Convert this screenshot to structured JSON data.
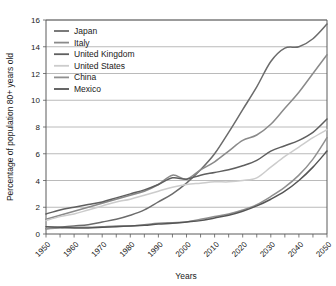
{
  "chart_data": {
    "type": "line",
    "title": "",
    "xlabel": "Years",
    "ylabel": "Percentage of population 80+ years old",
    "xlim": [
      1950,
      2050
    ],
    "ylim": [
      0,
      16
    ],
    "yticks": [
      0,
      2,
      4,
      6,
      8,
      10,
      12,
      14,
      16
    ],
    "xticks": [
      1950,
      1960,
      1970,
      1980,
      1990,
      2000,
      2010,
      2020,
      2030,
      2040,
      2050
    ],
    "xtick_labels": [
      "1950",
      "1960",
      "1970",
      "1980",
      "1990",
      "2000",
      "2010",
      "2020",
      "2030",
      "2040",
      "2050"
    ],
    "ytick_labels": [
      "0",
      "2",
      "4",
      "6",
      "8",
      "10",
      "12",
      "14",
      "16"
    ],
    "xtick_minor_step": 5,
    "grid": "horizontal",
    "legend_position": "upper-left",
    "x": [
      1950,
      1955,
      1960,
      1965,
      1970,
      1975,
      1980,
      1985,
      1990,
      1995,
      2000,
      2005,
      2010,
      2015,
      2020,
      2025,
      2030,
      2035,
      2040,
      2045,
      2050
    ],
    "series": [
      {
        "name": "Japan",
        "color": "#6b6b6b",
        "values": [
          0.4,
          0.5,
          0.6,
          0.7,
          0.9,
          1.1,
          1.4,
          1.8,
          2.4,
          3.0,
          3.8,
          4.8,
          6.0,
          7.6,
          9.3,
          11.0,
          12.9,
          13.9,
          14.0,
          14.6,
          15.7
        ]
      },
      {
        "name": "Italy",
        "color": "#8a8a8a",
        "values": [
          1.1,
          1.4,
          1.7,
          2.0,
          2.3,
          2.6,
          2.9,
          3.2,
          3.7,
          4.4,
          4.1,
          4.8,
          5.4,
          6.2,
          7.0,
          7.4,
          8.2,
          9.4,
          10.6,
          12.0,
          13.4
        ]
      },
      {
        "name": "United Kingdom",
        "color": "#5f5f5f",
        "values": [
          1.5,
          1.8,
          2.0,
          2.2,
          2.4,
          2.7,
          3.0,
          3.3,
          3.7,
          4.2,
          4.1,
          4.4,
          4.6,
          4.8,
          5.1,
          5.5,
          6.2,
          6.6,
          7.0,
          7.6,
          8.6
        ]
      },
      {
        "name": "United States",
        "color": "#cccccc",
        "values": [
          1.0,
          1.3,
          1.5,
          1.8,
          2.1,
          2.4,
          2.6,
          2.9,
          3.2,
          3.5,
          3.7,
          3.8,
          3.9,
          3.9,
          4.0,
          4.2,
          5.0,
          5.8,
          6.5,
          7.2,
          7.8
        ]
      },
      {
        "name": "China",
        "color": "#909090",
        "values": [
          0.4,
          0.45,
          0.5,
          0.5,
          0.55,
          0.6,
          0.6,
          0.7,
          0.8,
          0.85,
          0.9,
          1.1,
          1.3,
          1.5,
          1.8,
          2.2,
          2.8,
          3.5,
          4.4,
          5.6,
          7.2
        ]
      },
      {
        "name": "Mexico",
        "color": "#555555",
        "values": [
          0.55,
          0.5,
          0.45,
          0.45,
          0.5,
          0.55,
          0.6,
          0.65,
          0.75,
          0.8,
          0.9,
          1.0,
          1.2,
          1.4,
          1.7,
          2.1,
          2.6,
          3.2,
          4.0,
          5.0,
          6.2
        ]
      }
    ]
  },
  "legend": {
    "entries": [
      {
        "label": "Japan"
      },
      {
        "label": "Italy"
      },
      {
        "label": "United Kingdom"
      },
      {
        "label": "United States"
      },
      {
        "label": "China"
      },
      {
        "label": "Mexico"
      }
    ]
  },
  "axes": {
    "y_title": "Percentage of population 80+ years old",
    "x_title": "Years"
  }
}
